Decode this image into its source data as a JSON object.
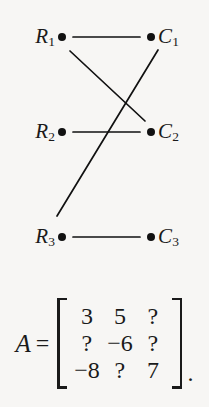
{
  "figure": {
    "background_color": "#f7f6f4",
    "ink_color": "#111111"
  },
  "graph": {
    "type": "bipartite-graph",
    "row_nodes": [
      {
        "id": "R1",
        "label_base": "R",
        "label_sub": "1",
        "x": 62,
        "y": 37
      },
      {
        "id": "R2",
        "label_base": "R",
        "label_sub": "2",
        "x": 62,
        "y": 132
      },
      {
        "id": "R3",
        "label_base": "R",
        "label_sub": "3",
        "x": 62,
        "y": 237
      }
    ],
    "col_nodes": [
      {
        "id": "C1",
        "label_base": "C",
        "label_sub": "1",
        "x": 151,
        "y": 37
      },
      {
        "id": "C2",
        "label_base": "C",
        "label_sub": "2",
        "x": 151,
        "y": 132
      },
      {
        "id": "C3",
        "label_base": "C",
        "label_sub": "3",
        "x": 151,
        "y": 237
      }
    ],
    "edges": [
      {
        "from": "R1",
        "to": "C1",
        "x1": 73,
        "y1": 37,
        "x2": 140,
        "y2": 37
      },
      {
        "from": "R1",
        "to": "C2",
        "x1": 70,
        "y1": 51,
        "x2": 145,
        "y2": 121
      },
      {
        "from": "C1",
        "to": "R3",
        "x1": 158,
        "y1": 50,
        "x2": 57,
        "y2": 216
      },
      {
        "from": "R2",
        "to": "C2",
        "x1": 73,
        "y1": 132,
        "x2": 140,
        "y2": 132
      },
      {
        "from": "R3",
        "to": "C3",
        "x1": 73,
        "y1": 237,
        "x2": 140,
        "y2": 237
      }
    ],
    "stroke_width": 1.7
  },
  "matrix_equation": {
    "name": "A",
    "equals": "=",
    "left_bracket": "[",
    "right_bracket": "]",
    "trailing_punctuation": ".",
    "rows": [
      [
        "3",
        "5",
        "?"
      ],
      [
        "?",
        "−6",
        "?"
      ],
      [
        "−8",
        "?",
        "7"
      ]
    ]
  }
}
